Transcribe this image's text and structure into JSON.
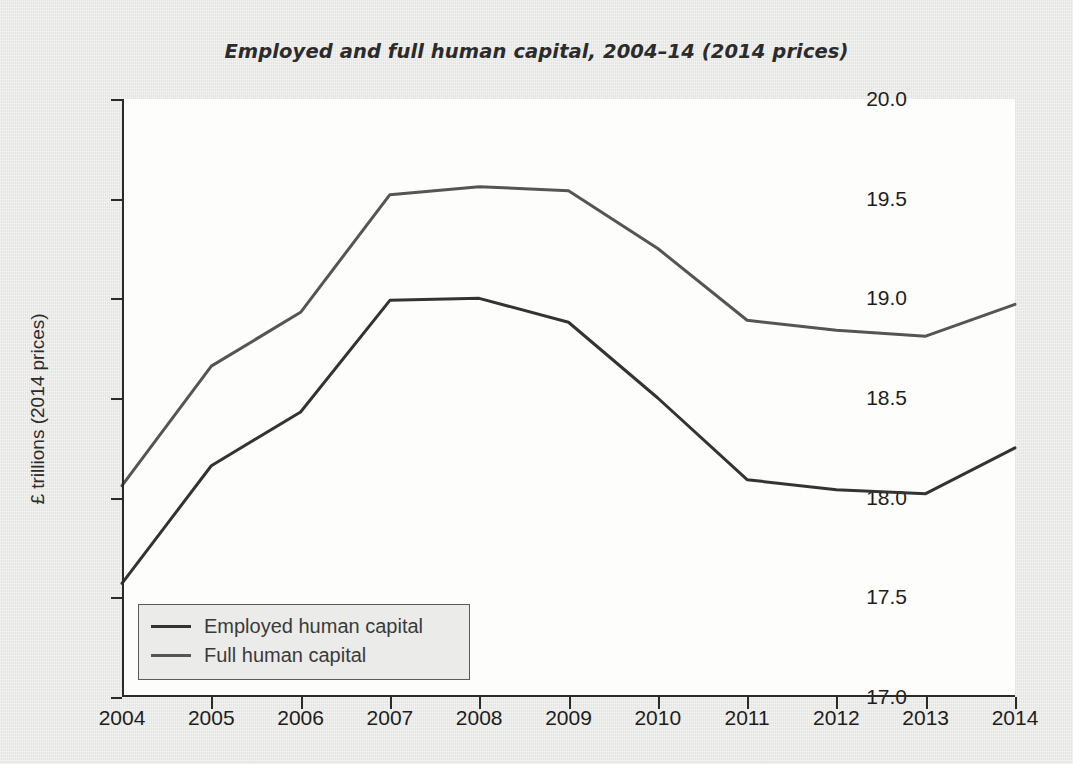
{
  "chart_data": {
    "type": "line",
    "title": "Employed and full human capital, 2004–14 (2014 prices)",
    "xlabel": "",
    "ylabel": "£ trillions (2014 prices)",
    "categories": [
      "2004",
      "2005",
      "2006",
      "2007",
      "2008",
      "2009",
      "2010",
      "2011",
      "2012",
      "2013",
      "2014"
    ],
    "x": [
      2004,
      2005,
      2006,
      2007,
      2008,
      2009,
      2010,
      2011,
      2012,
      2013,
      2014
    ],
    "ylim": [
      17.0,
      20.0
    ],
    "ytick_labels": [
      "20.0",
      "19.5",
      "19.0",
      "18.5",
      "18.0",
      "17.5",
      "17.0"
    ],
    "ytick_values": [
      20.0,
      19.5,
      19.0,
      18.5,
      18.0,
      17.5,
      17.0
    ],
    "grid": false,
    "legend_position": "bottom-left",
    "series": [
      {
        "name": "Employed human capital",
        "color": "#333333",
        "values": [
          17.57,
          18.16,
          18.43,
          18.99,
          19.0,
          18.88,
          18.5,
          18.09,
          18.04,
          18.02,
          18.25
        ]
      },
      {
        "name": "Full human capital",
        "color": "#555555",
        "values": [
          18.06,
          18.66,
          18.93,
          19.52,
          19.56,
          19.54,
          19.25,
          18.89,
          18.84,
          18.81,
          18.97
        ]
      }
    ]
  },
  "legend": {
    "items": [
      {
        "label": "Employed human capital",
        "color": "#333333"
      },
      {
        "label": "Full human capital",
        "color": "#555555"
      }
    ]
  },
  "source_note": ""
}
